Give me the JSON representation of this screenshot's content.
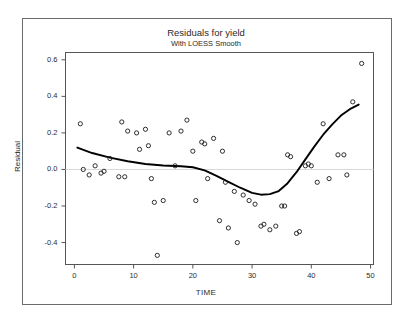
{
  "chart_data": {
    "type": "scatter",
    "title": "Residuals for yield",
    "subtitle": "With LOESS Smooth",
    "xlabel": "TIME",
    "ylabel": "Residual",
    "xlim": [
      -1.5,
      50.5
    ],
    "ylim": [
      -0.52,
      0.64
    ],
    "grid": false,
    "legend": null,
    "xticks": [
      0,
      10,
      20,
      30,
      40,
      50
    ],
    "xtick_labels": [
      "0",
      "10",
      "20",
      "30",
      "40",
      "50"
    ],
    "yticks": [
      0.6,
      0.4,
      0.2,
      0.0,
      -0.2,
      -0.4
    ],
    "ytick_labels": [
      "0.6",
      "0.4",
      "0.2",
      "0.0",
      "-0.2",
      "-0.4"
    ],
    "reference_line_y": 0.0,
    "marker": "open-circle",
    "marker_color": "#1a1a1a",
    "line_color": "#000000",
    "series": [
      {
        "name": "Residual",
        "type": "scatter",
        "points": [
          [
            1.0,
            0.25
          ],
          [
            1.5,
            0.0
          ],
          [
            2.5,
            -0.03
          ],
          [
            3.5,
            0.02
          ],
          [
            4.5,
            -0.02
          ],
          [
            5.0,
            -0.01
          ],
          [
            6.0,
            0.06
          ],
          [
            7.5,
            -0.04
          ],
          [
            8.5,
            -0.04
          ],
          [
            8.0,
            0.26
          ],
          [
            9.0,
            0.21
          ],
          [
            10.5,
            0.2
          ],
          [
            11.0,
            0.11
          ],
          [
            12.0,
            0.22
          ],
          [
            12.5,
            0.13
          ],
          [
            13.0,
            -0.05
          ],
          [
            13.5,
            -0.18
          ],
          [
            14.0,
            -0.47
          ],
          [
            15.0,
            -0.17
          ],
          [
            16.0,
            0.2
          ],
          [
            17.0,
            0.02
          ],
          [
            18.0,
            0.21
          ],
          [
            19.0,
            0.27
          ],
          [
            20.0,
            0.1
          ],
          [
            20.5,
            -0.17
          ],
          [
            21.5,
            0.15
          ],
          [
            22.0,
            0.14
          ],
          [
            22.5,
            -0.05
          ],
          [
            23.5,
            0.17
          ],
          [
            24.5,
            -0.28
          ],
          [
            25.0,
            0.1
          ],
          [
            25.5,
            -0.07
          ],
          [
            26.0,
            -0.32
          ],
          [
            27.0,
            -0.12
          ],
          [
            27.5,
            -0.4
          ],
          [
            28.5,
            -0.14
          ],
          [
            29.5,
            -0.17
          ],
          [
            30.5,
            -0.19
          ],
          [
            31.5,
            -0.31
          ],
          [
            32.0,
            -0.3
          ],
          [
            33.0,
            -0.33
          ],
          [
            34.0,
            -0.31
          ],
          [
            35.0,
            -0.2
          ],
          [
            35.5,
            -0.2
          ],
          [
            36.0,
            0.08
          ],
          [
            36.5,
            0.07
          ],
          [
            37.5,
            -0.35
          ],
          [
            38.0,
            -0.34
          ],
          [
            39.0,
            0.02
          ],
          [
            39.5,
            0.03
          ],
          [
            40.0,
            0.02
          ],
          [
            41.0,
            -0.07
          ],
          [
            42.0,
            0.25
          ],
          [
            43.0,
            -0.05
          ],
          [
            44.5,
            0.08
          ],
          [
            45.5,
            0.08
          ],
          [
            46.0,
            -0.03
          ],
          [
            47.0,
            0.37
          ],
          [
            48.5,
            0.58
          ]
        ]
      },
      {
        "name": "LOESS Smooth",
        "type": "line",
        "points": [
          [
            0.5,
            0.12
          ],
          [
            3.0,
            0.09
          ],
          [
            6.0,
            0.065
          ],
          [
            9.0,
            0.045
          ],
          [
            12.0,
            0.03
          ],
          [
            15.0,
            0.022
          ],
          [
            18.0,
            0.018
          ],
          [
            20.0,
            0.012
          ],
          [
            22.0,
            -0.005
          ],
          [
            24.0,
            -0.035
          ],
          [
            26.0,
            -0.068
          ],
          [
            28.0,
            -0.1
          ],
          [
            30.0,
            -0.128
          ],
          [
            31.5,
            -0.138
          ],
          [
            33.0,
            -0.135
          ],
          [
            34.5,
            -0.118
          ],
          [
            36.0,
            -0.075
          ],
          [
            37.5,
            -0.015
          ],
          [
            39.0,
            0.055
          ],
          [
            40.5,
            0.125
          ],
          [
            42.0,
            0.19
          ],
          [
            43.5,
            0.245
          ],
          [
            45.0,
            0.295
          ],
          [
            46.5,
            0.33
          ],
          [
            48.0,
            0.355
          ]
        ]
      }
    ]
  }
}
